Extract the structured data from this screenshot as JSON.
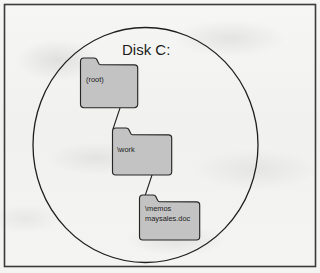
{
  "diagram": {
    "title": "Disk C:",
    "container_shape": "circle",
    "border_shape": "rectangle",
    "colors": {
      "folder_fill": "#c3c3c3",
      "outline": "#2b2b2b",
      "paper": "#f2f2f0",
      "text": "#1c1c1c"
    },
    "folders": [
      {
        "id": "root",
        "label": "(root)",
        "lines": [
          "(root)"
        ]
      },
      {
        "id": "work",
        "label": "\\work",
        "lines": [
          "\\work"
        ]
      },
      {
        "id": "memos",
        "label": "\\memos",
        "lines": [
          "\\memos",
          "maysales.doc"
        ]
      }
    ],
    "connectors": [
      {
        "from": "root",
        "to": "work"
      },
      {
        "from": "work",
        "to": "memos"
      }
    ]
  }
}
